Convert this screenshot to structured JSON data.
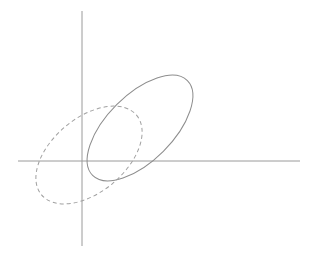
{
  "figure": {
    "title": "",
    "background_color": "#ffffff",
    "width": 317,
    "height": 265
  },
  "chart_data": {
    "type": "scatter",
    "title": "",
    "subtitle": "",
    "xlabel": "",
    "ylabel": "",
    "grid": false,
    "legend": null,
    "axes": {
      "origin_px": [
        82,
        161
      ],
      "x_axis": {
        "label": "",
        "tick_labels": [],
        "start_px": [
          18,
          161
        ],
        "end_px": [
          300,
          161
        ],
        "color": "#9a9a9a",
        "line_width": 1
      },
      "y_axis": {
        "label": "",
        "tick_labels": [],
        "start_px": [
          82,
          11
        ],
        "end_px": [
          82,
          246
        ],
        "color": "#9a9a9a",
        "line_width": 1
      }
    },
    "series": [
      {
        "name": "solid-ellipse",
        "shape": "ellipse",
        "line_style": "solid",
        "color": "#8d8d8d",
        "line_width": 1,
        "center_px": [
          140,
          128
        ],
        "semi_major_px": 67,
        "semi_minor_px": 33,
        "rotation_deg": -45,
        "dash_array": "",
        "bbox_px": {
          "left": 89,
          "top": 76,
          "right": 193,
          "bottom": 181
        }
      },
      {
        "name": "dashed-ellipse",
        "shape": "ellipse",
        "line_style": "dashed",
        "color": "#a0a0a0",
        "line_width": 1,
        "center_px": [
          89,
          155
        ],
        "semi_major_px": 62,
        "semi_minor_px": 37,
        "rotation_deg": -40,
        "dash_array": "4 3",
        "bbox_px": {
          "left": 36,
          "top": 103,
          "right": 142,
          "bottom": 207
        }
      }
    ]
  }
}
